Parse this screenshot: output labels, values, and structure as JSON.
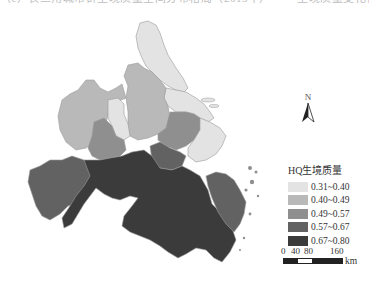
{
  "header": {
    "cropped_text": "（c）长三角城市群生境质量空间分布格局（2015年）—— 生境质量变化特征"
  },
  "map": {
    "title": "HQ生境质量",
    "region": "Yangtze River Delta",
    "north_arrow": {
      "label": "N",
      "icon": "north-arrow-icon"
    }
  },
  "legend": {
    "title": "HQ生境质量",
    "items": [
      {
        "label": "0.31~0.40",
        "color": "#e3e3e3"
      },
      {
        "label": "0.40~0.49",
        "color": "#b9b9b9"
      },
      {
        "label": "0.49~0.57",
        "color": "#8f8f8f"
      },
      {
        "label": "0.57~0.67",
        "color": "#626262"
      },
      {
        "label": "0.67~0.80",
        "color": "#3b3b3b"
      }
    ]
  },
  "scale_bar": {
    "ticks": [
      "0",
      "40",
      "80",
      "160"
    ],
    "unit": "km"
  },
  "colors": {
    "class1": "#e3e3e3",
    "class2": "#b9b9b9",
    "class3": "#8f8f8f",
    "class4": "#626262",
    "class5": "#3b3b3b",
    "boundary": "#8a8a8a"
  }
}
